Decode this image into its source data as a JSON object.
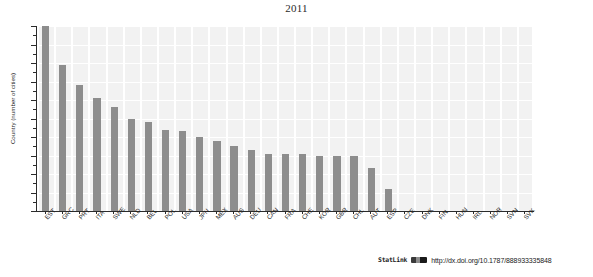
{
  "chart_data": {
    "type": "bar",
    "title": "2011",
    "xlabel": "",
    "ylabel": "Country (number of cities)",
    "ylim": [
      0,
      100
    ],
    "ytick_values": [
      0,
      10,
      20,
      30,
      40,
      50,
      60,
      70,
      80,
      90,
      100
    ],
    "grid": true,
    "legend": "none",
    "bar_color": "#8d8d8d",
    "plot_background": "#f2f2f2",
    "categories": [
      "EST",
      "GRC",
      "PRT",
      "ITA",
      "SWE",
      "NLD",
      "BEL",
      "POL",
      "USA",
      "JPN",
      "MEX",
      "AUS",
      "DEU",
      "CAN",
      "FRA",
      "CHE",
      "KOR",
      "GBR",
      "CHL",
      "AUT",
      "ESP",
      "CZE",
      "DNK",
      "FIN",
      "HUN",
      "IRL",
      "NOR",
      "SVN",
      "SVK"
    ],
    "values": [
      100,
      79,
      68,
      61,
      56,
      50,
      48,
      44,
      43,
      40,
      38,
      35,
      33,
      31,
      31,
      31,
      30,
      30,
      30,
      23,
      12,
      0,
      0,
      0,
      0,
      0,
      0,
      0,
      0
    ]
  },
  "footer": {
    "statlink_label": "StatLink",
    "statlink_glyph": "barcode-icon",
    "statlink_url": "http://dx.doi.org/10.1787/888933335848"
  }
}
